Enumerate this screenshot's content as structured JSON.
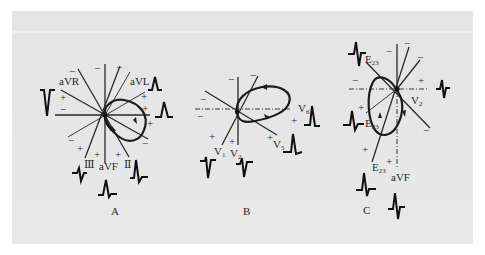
{
  "figure": {
    "background_color": "#e6e6e6",
    "panels": [
      {
        "id": "A",
        "caption": "A",
        "lead_labels": {
          "aVR": "aVR",
          "aVL": "aVL",
          "III": "Ⅲ",
          "aVF": "aVF",
          "II": "Ⅱ"
        },
        "signs": {
          "plus": "+",
          "minus": "−"
        }
      },
      {
        "id": "B",
        "caption": "B",
        "lead_labels": {
          "V6": "V",
          "V6_sub": "6",
          "V5": "V",
          "V5_sub": "5",
          "V1": "V",
          "V1_sub": "1",
          "V2": "V",
          "V2_sub": "2"
        },
        "signs": {
          "plus": "+",
          "minus": "−"
        }
      },
      {
        "id": "C",
        "caption": "C",
        "lead_labels": {
          "E23_top": "E",
          "E23_top_sub": "23",
          "E23_mid": "E",
          "E23_mid_sub": "23",
          "E23_low": "E",
          "E23_low_sub": "23",
          "V2": "V",
          "V2_sub": "2",
          "aVF": "aVF"
        },
        "signs": {
          "plus": "+",
          "minus": "−"
        }
      }
    ]
  }
}
